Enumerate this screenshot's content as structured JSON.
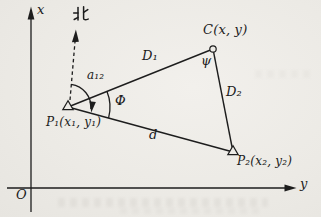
{
  "figure": {
    "kind": "surveying-triangle-diagram"
  },
  "axes": {
    "x_label": "x",
    "y_label": "y",
    "origin_label": "O"
  },
  "compass": {
    "north_label": "北"
  },
  "points": [
    {
      "id": "P1",
      "label": "P₁(x₁, y₁)",
      "marker": "open-triangle"
    },
    {
      "id": "P2",
      "label": "P₂(x₂, y₂)",
      "marker": "open-triangle"
    },
    {
      "id": "C",
      "label": "C(x, y)",
      "marker": "open-circle"
    }
  ],
  "edges": [
    {
      "id": "D1",
      "label": "D₁",
      "from": "P1",
      "to": "C"
    },
    {
      "id": "D2",
      "label": "D₂",
      "from": "C",
      "to": "P2"
    },
    {
      "id": "d",
      "label": "d",
      "from": "P1",
      "to": "P2"
    }
  ],
  "angles": [
    {
      "id": "a12",
      "label": "a₁₂",
      "vertex": "P1"
    },
    {
      "id": "phi",
      "label": "Φ",
      "vertex": "P1"
    },
    {
      "id": "psi",
      "label": "ψ",
      "vertex": "C"
    }
  ],
  "colors": {
    "ink": "#1d1d1d",
    "paper": "#edebe6"
  }
}
